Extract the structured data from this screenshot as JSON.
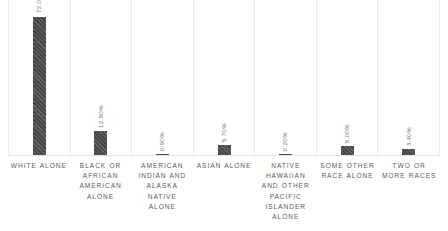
{
  "chart_data": {
    "type": "bar",
    "title": "",
    "subtitle": "",
    "xlabel": "",
    "ylabel": "",
    "ylim": [
      0,
      80
    ],
    "grid": "vertical-category-separators",
    "legend": "none",
    "orientation": "vertical",
    "value_label_format": "percent-two-decimals",
    "value_label_rotation": "90-degrees-bottom-to-top",
    "bar_color": "#484848",
    "gridline_color": "#eaeaea",
    "label_color": "#5a5a5a",
    "background_color": "#ffffff",
    "categories": [
      "WHITE ALONE",
      "BLACK OR AFRICAN AMERICAN ALONE",
      "AMERICAN INDIAN AND ALASKA NATIVE ALONE",
      "ASIAN ALONE",
      "NATIVE HAWAIIAN AND OTHER PACIFIC ISLANDER ALONE",
      "SOME OTHER RACE ALONE",
      "TWO OR MORE RACES"
    ],
    "values": [
      72.0,
      12.8,
      0.9,
      5.7,
      0.2,
      5.0,
      3.4
    ],
    "value_labels": [
      "72.00%",
      "12.80%",
      "0.90%",
      "5.70%",
      "0.20%",
      "5.00%",
      "3.40%"
    ],
    "bars": [
      {
        "category": "WHITE ALONE",
        "value": 72.0,
        "label": "72.00%"
      },
      {
        "category": "BLACK OR AFRICAN AMERICAN ALONE",
        "value": 12.8,
        "label": "12.80%"
      },
      {
        "category": "AMERICAN INDIAN AND ALASKA NATIVE ALONE",
        "value": 0.9,
        "label": "0.90%"
      },
      {
        "category": "ASIAN ALONE",
        "value": 5.7,
        "label": "5.70%"
      },
      {
        "category": "NATIVE HAWAIIAN AND OTHER PACIFIC ISLANDER ALONE",
        "value": 0.2,
        "label": "0.20%"
      },
      {
        "category": "SOME OTHER RACE ALONE",
        "value": 5.0,
        "label": "5.00%"
      },
      {
        "category": "TWO OR MORE RACES",
        "value": 3.4,
        "label": "3.40%"
      }
    ]
  }
}
